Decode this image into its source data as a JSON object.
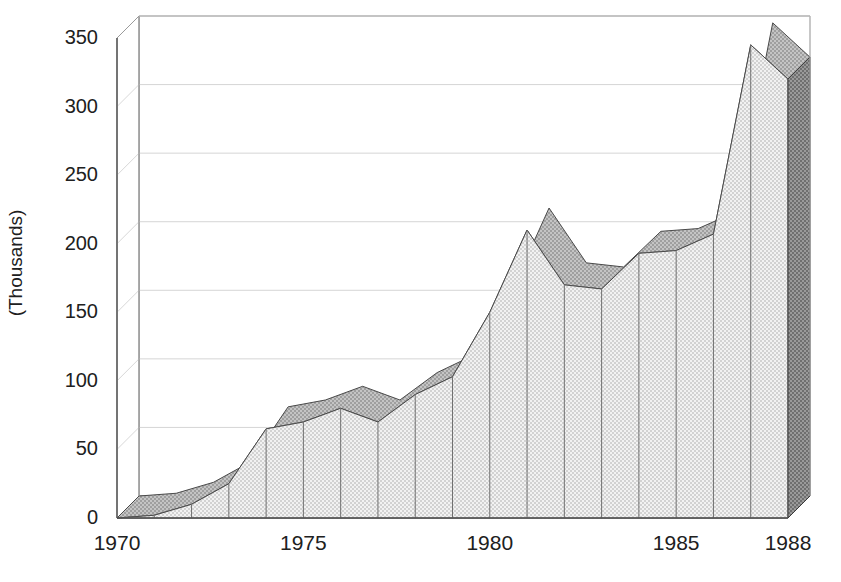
{
  "chart_data": {
    "type": "area",
    "title": "",
    "subtitle": "",
    "xlabel": "",
    "ylabel": "(Thousands)",
    "x": [
      1970,
      1971,
      1972,
      1973,
      1974,
      1975,
      1976,
      1977,
      1978,
      1979,
      1980,
      1981,
      1982,
      1983,
      1984,
      1985,
      1986,
      1987,
      1988
    ],
    "categories": [
      "1970",
      "1971",
      "1972",
      "1973",
      "1974",
      "1975",
      "1976",
      "1977",
      "1978",
      "1979",
      "1980",
      "1981",
      "1982",
      "1983",
      "1984",
      "1985",
      "1986",
      "1987",
      "1988"
    ],
    "values": [
      0,
      2,
      10,
      25,
      65,
      70,
      80,
      70,
      90,
      103,
      150,
      210,
      170,
      167,
      193,
      195,
      207,
      345,
      320
    ],
    "series": [
      {
        "name": "series-1",
        "values": [
          0,
          2,
          10,
          25,
          65,
          70,
          80,
          70,
          90,
          103,
          150,
          210,
          170,
          167,
          193,
          195,
          207,
          345,
          320
        ]
      }
    ],
    "xlim": [
      1970,
      1988
    ],
    "ylim": [
      0,
      350
    ],
    "ytick_values": [
      0,
      50,
      100,
      150,
      200,
      250,
      300,
      350
    ],
    "ytick_labels": [
      "0",
      "50",
      "100",
      "150",
      "200",
      "250",
      "300",
      "350"
    ],
    "xtick_values": [
      1970,
      1975,
      1980,
      1985,
      1988
    ],
    "xtick_labels": [
      "1970",
      "1975",
      "1980",
      "1985",
      "1988"
    ],
    "grid": true,
    "legend": false,
    "legend_position": "none",
    "style": "3d-area",
    "colors": {
      "area_top": "#d9d9d9",
      "area_front": "#dcdcdc",
      "area_side": "#8c8c8c",
      "floor": "#fdfdfd",
      "grid": "#c8c8c8",
      "axis": "#555555",
      "text": "#202020"
    }
  },
  "axis": {
    "ylabel": "(Thousands)"
  }
}
